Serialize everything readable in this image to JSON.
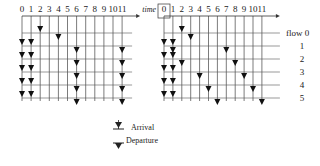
{
  "left_grid": {
    "columns": [
      "0",
      "1",
      "2",
      "3",
      "4",
      "5",
      "6",
      "7",
      "8",
      "9",
      "10",
      "11"
    ],
    "x0": 22,
    "dx": 9.1,
    "y_axis": 16,
    "rows_y": [
      33,
      46,
      59,
      72,
      85,
      98
    ],
    "arrivals": [
      {
        "col": 2,
        "row": 0
      },
      {
        "col": 0,
        "row": 1
      },
      {
        "col": 1,
        "row": 1
      },
      {
        "col": 0,
        "row": 2
      },
      {
        "col": 1,
        "row": 2
      },
      {
        "col": 0,
        "row": 3
      },
      {
        "col": 1,
        "row": 3
      },
      {
        "col": 0,
        "row": 4
      },
      {
        "col": 1,
        "row": 4
      },
      {
        "col": 0,
        "row": 5
      },
      {
        "col": 1,
        "row": 5
      }
    ],
    "departures": [
      {
        "col": 4,
        "row": 0
      },
      {
        "col": 6,
        "row": 1
      },
      {
        "col": 11,
        "row": 1
      },
      {
        "col": 6,
        "row": 2
      },
      {
        "col": 11,
        "row": 2
      },
      {
        "col": 6,
        "row": 3
      },
      {
        "col": 11,
        "row": 3
      },
      {
        "col": 6,
        "row": 4
      },
      {
        "col": 11,
        "row": 4
      },
      {
        "col": 6,
        "row": 5
      },
      {
        "col": 11,
        "row": 5
      }
    ]
  },
  "right_grid": {
    "time_label": "time",
    "columns": [
      "0",
      "1",
      "2",
      "3",
      "4",
      "5",
      "6",
      "7",
      "8",
      "9",
      "10",
      "11"
    ],
    "x0": 164,
    "dx": 8.9,
    "y_axis": 16,
    "rows_y": [
      33,
      46,
      59,
      72,
      85,
      98
    ],
    "flow_labels": [
      "flow 0",
      "1",
      "2",
      "3",
      "4",
      "5"
    ],
    "arrivals": [
      {
        "col": 2,
        "row": 0
      },
      {
        "col": 0,
        "row": 1
      },
      {
        "col": 1,
        "row": 1
      },
      {
        "col": 0,
        "row": 2
      },
      {
        "col": 1,
        "row": 2
      },
      {
        "col": 0,
        "row": 3
      },
      {
        "col": 1,
        "row": 3
      },
      {
        "col": 0,
        "row": 4
      },
      {
        "col": 1,
        "row": 4
      },
      {
        "col": 0,
        "row": 5
      },
      {
        "col": 1,
        "row": 5
      }
    ],
    "departures": [
      {
        "col": 3,
        "row": 0
      },
      {
        "col": 1,
        "row": 1
      },
      {
        "col": 7,
        "row": 1
      },
      {
        "col": 2,
        "row": 2
      },
      {
        "col": 8,
        "row": 2
      },
      {
        "col": 4,
        "row": 3
      },
      {
        "col": 9,
        "row": 3
      },
      {
        "col": 5,
        "row": 4
      },
      {
        "col": 10,
        "row": 4
      },
      {
        "col": 6,
        "row": 5
      },
      {
        "col": 11,
        "row": 5
      }
    ]
  },
  "legend": {
    "arrival": "Arrival",
    "departure": "Departure"
  }
}
